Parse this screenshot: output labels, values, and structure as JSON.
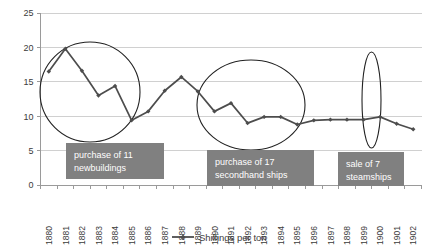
{
  "chart_data": {
    "type": "line",
    "title": "",
    "xlabel": "",
    "ylabel": "",
    "ylim": [
      0,
      25
    ],
    "ytick_values": [
      0,
      5,
      10,
      15,
      20,
      25
    ],
    "grid": true,
    "legend_position": "bottom",
    "categories": [
      "1880",
      "1881",
      "1882",
      "1883",
      "1884",
      "1885",
      "1886",
      "1887",
      "1888",
      "1889",
      "1890",
      "1891",
      "1892",
      "1893",
      "1894",
      "1895",
      "1896",
      "1897",
      "1898",
      "1899",
      "1900",
      "1901",
      "1902"
    ],
    "series": [
      {
        "name": "Shillings per ton",
        "color": "#4d4d4d",
        "values": [
          16.5,
          19.8,
          16.6,
          13.0,
          14.4,
          9.4,
          10.7,
          13.7,
          15.7,
          13.6,
          10.7,
          11.9,
          9.0,
          9.9,
          9.9,
          8.8,
          9.4,
          9.5,
          9.5,
          9.5,
          9.9,
          8.9,
          8.1
        ]
      }
    ],
    "annotations": [
      {
        "id": "annotation-newbuildings",
        "line1": "purchase of  11",
        "line2": "newbuildings",
        "box": {
          "x": 66,
          "y": 143,
          "width": 98,
          "height": 36
        },
        "highlight_ellipse": {
          "cx": 90,
          "cy": 92,
          "rx": 50,
          "ry": 50
        }
      },
      {
        "id": "annotation-secondhand-ships",
        "line1": "purchase of 17",
        "line2": "secondhand ships",
        "box": {
          "x": 207,
          "y": 150,
          "width": 107,
          "height": 36
        },
        "highlight_ellipse": {
          "cx": 251,
          "cy": 105,
          "rx": 54,
          "ry": 45
        }
      },
      {
        "id": "annotation-sale-steamships",
        "line1": "sale of 7",
        "line2": "steamships",
        "box": {
          "x": 338,
          "y": 152,
          "width": 66,
          "height": 34
        },
        "highlight_ellipse": {
          "cx": 371.5,
          "cy": 100,
          "rx": 9.5,
          "ry": 48
        }
      }
    ]
  },
  "legend": {
    "entries": [
      {
        "label": "Shillings per ton",
        "color": "#4d4d4d"
      }
    ]
  },
  "axis": {
    "y_labels": [
      "25",
      "20",
      "15",
      "10",
      "5",
      "0"
    ],
    "x_labels": [
      "1880",
      "1881",
      "1882",
      "1883",
      "1884",
      "1885",
      "1886",
      "1887",
      "1888",
      "1889",
      "1890",
      "1891",
      "1892",
      "1893",
      "1894",
      "1895",
      "1896",
      "1897",
      "1898",
      "1899",
      "1900",
      "1901",
      "1902"
    ]
  }
}
